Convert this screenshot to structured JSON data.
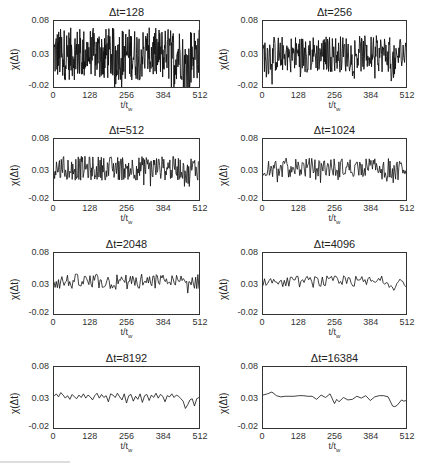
{
  "chart_data": [
    {
      "type": "line",
      "title": "Δt=128",
      "xlabel": "t/t_w",
      "ylabel": "χ(Δt)",
      "xlim": [
        0,
        512
      ],
      "ylim": [
        -0.02,
        0.08
      ],
      "xticks": [
        "0",
        "128",
        "256",
        "384",
        "512"
      ],
      "yticks": [
        "0.08",
        "0.03",
        "-0.02"
      ],
      "noise_amplitude": 0.05,
      "points": 400,
      "mean": 0.03
    },
    {
      "type": "line",
      "title": "Δt=256",
      "xlabel": "t/t_w",
      "ylabel": "χ(Δt)",
      "xlim": [
        0,
        512
      ],
      "ylim": [
        -0.02,
        0.08
      ],
      "xticks": [
        "0",
        "128",
        "256",
        "384",
        "512"
      ],
      "yticks": [
        "0.08",
        "0.03",
        "-0.02"
      ],
      "noise_amplitude": 0.035,
      "points": 300,
      "mean": 0.03
    },
    {
      "type": "line",
      "title": "Δt=512",
      "xlabel": "t/t_w",
      "ylabel": "χ(Δt)",
      "xlim": [
        0,
        512
      ],
      "ylim": [
        -0.02,
        0.08
      ],
      "xticks": [
        "0",
        "128",
        "256",
        "384",
        "512"
      ],
      "yticks": [
        "0.08",
        "0.03",
        "-0.02"
      ],
      "noise_amplitude": 0.025,
      "points": 240,
      "mean": 0.032
    },
    {
      "type": "line",
      "title": "Δt=1024",
      "xlabel": "t/t_w",
      "ylabel": "χ(Δt)",
      "xlim": [
        0,
        512
      ],
      "ylim": [
        -0.02,
        0.08
      ],
      "xticks": [
        "0",
        "128",
        "256",
        "384",
        "512"
      ],
      "yticks": [
        "0.08",
        "0.03",
        "-0.02"
      ],
      "noise_amplitude": 0.02,
      "points": 180,
      "mean": 0.033
    },
    {
      "type": "line",
      "title": "Δt=2048",
      "xlabel": "t/t_w",
      "ylabel": "χ(Δt)",
      "xlim": [
        0,
        512
      ],
      "ylim": [
        -0.02,
        0.08
      ],
      "xticks": [
        "0",
        "128",
        "256",
        "384",
        "512"
      ],
      "yticks": [
        "0.08",
        "0.03",
        "-0.02"
      ],
      "noise_amplitude": 0.016,
      "points": 130,
      "mean": 0.033
    },
    {
      "type": "line",
      "title": "Δt=4096",
      "xlabel": "t/t_w",
      "ylabel": "χ(Δt)",
      "xlim": [
        0,
        512
      ],
      "ylim": [
        -0.02,
        0.08
      ],
      "xticks": [
        "0",
        "128",
        "256",
        "384",
        "512"
      ],
      "yticks": [
        "0.08",
        "0.03",
        "-0.02"
      ],
      "noise_amplitude": 0.012,
      "points": 95,
      "mean": 0.033
    },
    {
      "type": "line",
      "title": "Δt=8192",
      "xlabel": "t/t_w",
      "ylabel": "χ(Δt)",
      "xlim": [
        0,
        512
      ],
      "ylim": [
        -0.02,
        0.08
      ],
      "xticks": [
        "0",
        "128",
        "256",
        "384",
        "512"
      ],
      "yticks": [
        "0.08",
        "0.03",
        "-0.02"
      ],
      "x": [
        0,
        8,
        16,
        24,
        32,
        40,
        48,
        56,
        64,
        72,
        80,
        88,
        96,
        104,
        112,
        120,
        128,
        136,
        144,
        152,
        160,
        168,
        176,
        184,
        192,
        200,
        208,
        216,
        224,
        232,
        240,
        248,
        256,
        264,
        272,
        280,
        288,
        296,
        304,
        312,
        320,
        328,
        336,
        344,
        352,
        360,
        368,
        376,
        384,
        392,
        400,
        408,
        416,
        424,
        432,
        440,
        448,
        456,
        464,
        472,
        480,
        488,
        496,
        504,
        512
      ],
      "values": [
        0.032,
        0.036,
        0.031,
        0.038,
        0.034,
        0.029,
        0.033,
        0.027,
        0.035,
        0.031,
        0.028,
        0.034,
        0.03,
        0.036,
        0.029,
        0.034,
        0.031,
        0.026,
        0.033,
        0.037,
        0.029,
        0.035,
        0.03,
        0.033,
        0.023,
        0.036,
        0.034,
        0.03,
        0.037,
        0.031,
        0.026,
        0.036,
        0.021,
        0.033,
        0.035,
        0.024,
        0.032,
        0.027,
        0.036,
        0.022,
        0.033,
        0.035,
        0.025,
        0.034,
        0.03,
        0.037,
        0.029,
        0.035,
        0.032,
        0.023,
        0.033,
        0.031,
        0.036,
        0.03,
        0.034,
        0.032,
        0.028,
        0.024,
        0.012,
        0.018,
        0.026,
        0.028,
        0.016,
        0.028,
        0.03
      ]
    },
    {
      "type": "line",
      "title": "Δt=16384",
      "xlabel": "t/t_w",
      "ylabel": "χ(Δt)",
      "xlim": [
        0,
        512
      ],
      "ylim": [
        -0.02,
        0.08
      ],
      "xticks": [
        "0",
        "128",
        "256",
        "384",
        "512"
      ],
      "yticks": [
        "0.08",
        "0.03",
        "-0.02"
      ],
      "x": [
        0,
        16,
        32,
        48,
        64,
        80,
        96,
        112,
        128,
        144,
        160,
        176,
        192,
        208,
        224,
        240,
        256,
        264,
        272,
        288,
        304,
        320,
        336,
        352,
        368,
        384,
        400,
        416,
        432,
        448,
        464,
        472,
        480,
        496,
        504,
        512
      ],
      "values": [
        0.034,
        0.036,
        0.039,
        0.033,
        0.031,
        0.032,
        0.032,
        0.032,
        0.033,
        0.033,
        0.032,
        0.032,
        0.027,
        0.034,
        0.03,
        0.036,
        0.02,
        0.027,
        0.023,
        0.03,
        0.026,
        0.027,
        0.032,
        0.029,
        0.033,
        0.025,
        0.031,
        0.033,
        0.033,
        0.031,
        0.016,
        0.015,
        0.017,
        0.026,
        0.024,
        0.025
      ]
    }
  ],
  "panels": [
    {
      "title": "Δt=128",
      "ylabel": "χ(Δt)",
      "xlabel": "t/t",
      "xlabel_sub": "w"
    },
    {
      "title": "Δt=256",
      "ylabel": "χ(Δt)",
      "xlabel": "t/t",
      "xlabel_sub": "w"
    },
    {
      "title": "Δt=512",
      "ylabel": "χ(Δt)",
      "xlabel": "t/t",
      "xlabel_sub": "w"
    },
    {
      "title": "Δt=1024",
      "ylabel": "χ(Δt)",
      "xlabel": "t/t",
      "xlabel_sub": "w"
    },
    {
      "title": "Δt=2048",
      "ylabel": "χ(Δt)",
      "xlabel": "t/t",
      "xlabel_sub": "w"
    },
    {
      "title": "Δt=4096",
      "ylabel": "χ(Δt)",
      "xlabel": "t/t",
      "xlabel_sub": "w"
    },
    {
      "title": "Δt=8192",
      "ylabel": "χ(Δt)",
      "xlabel": "t/t",
      "xlabel_sub": "w"
    },
    {
      "title": "Δt=16384",
      "ylabel": "χ(Δt)",
      "xlabel": "t/t",
      "xlabel_sub": "w"
    }
  ],
  "axes": {
    "yticks": [
      "0.08",
      "0.03",
      "-0.02"
    ],
    "xticks": [
      "0",
      "128",
      "256",
      "384",
      "512"
    ]
  },
  "style": {
    "line_color": "#111111",
    "frame_color": "#333333"
  }
}
